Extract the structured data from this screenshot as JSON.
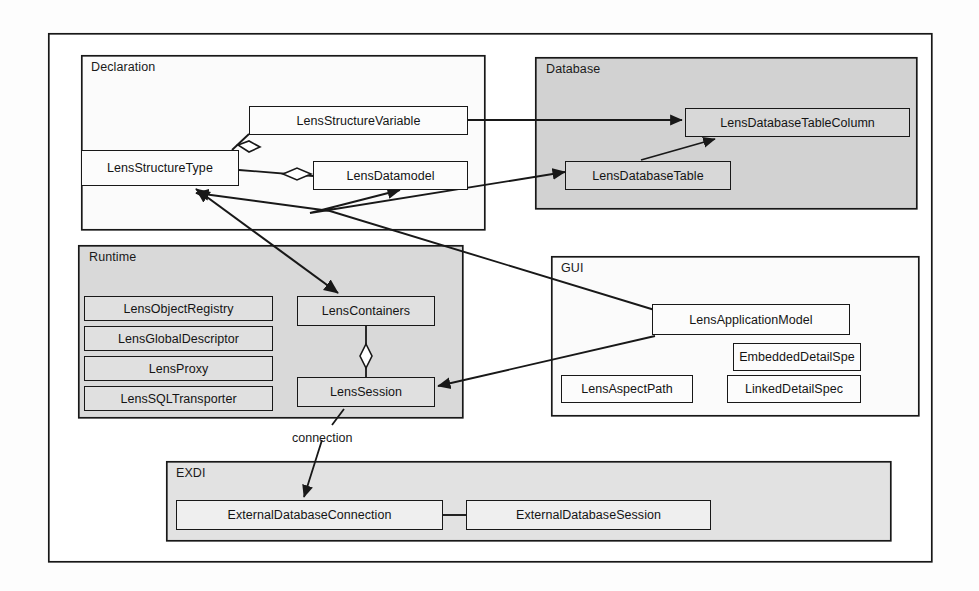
{
  "diagram": {
    "frame": {
      "x": 48,
      "y": 33,
      "w": 884,
      "h": 529
    },
    "colors": {
      "line": "#181818",
      "package_gray": "#d0d0d0",
      "package_white": "#fcfcfc",
      "class_fill": "#f7f7f7",
      "page_bg": "#fdfdfd"
    },
    "packages": [
      {
        "id": "declaration",
        "label": "Declaration",
        "x": 81,
        "y": 55,
        "w": 404,
        "h": 175,
        "fill": "#fbfbfb"
      },
      {
        "id": "database",
        "label": "Database",
        "x": 535,
        "y": 57,
        "w": 382,
        "h": 152,
        "fill": "#d2d2d2"
      },
      {
        "id": "runtime",
        "label": "Runtime",
        "x": 78,
        "y": 245,
        "w": 385,
        "h": 173,
        "fill": "#d9d9d9"
      },
      {
        "id": "gui",
        "label": "GUI",
        "x": 551,
        "y": 256,
        "w": 368,
        "h": 160,
        "fill": "#fbfbfb"
      },
      {
        "id": "exdi",
        "label": "EXDI",
        "x": 166,
        "y": 461,
        "w": 725,
        "h": 80,
        "fill": "#e2e2e2"
      }
    ],
    "classes": [
      {
        "id": "lens_structure_variable",
        "label": "LensStructureVariable",
        "x": 249,
        "y": 106,
        "w": 219,
        "h": 29,
        "pkg": "declaration"
      },
      {
        "id": "lens_structure_type",
        "label": "LensStructureType",
        "x": 81,
        "y": 150,
        "w": 158,
        "h": 36,
        "pkg": "declaration"
      },
      {
        "id": "lens_datamodel",
        "label": "LensDatamodel",
        "x": 313,
        "y": 161,
        "w": 155,
        "h": 29,
        "pkg": "declaration"
      },
      {
        "id": "lens_database_table_column",
        "label": "LensDatabaseTableColumn",
        "x": 685,
        "y": 108,
        "w": 225,
        "h": 29,
        "pkg": "database"
      },
      {
        "id": "lens_database_table",
        "label": "LensDatabaseTable",
        "x": 565,
        "y": 161,
        "w": 166,
        "h": 29,
        "pkg": "database"
      },
      {
        "id": "lens_object_registry",
        "label": "LensObjectRegistry",
        "x": 84,
        "y": 296,
        "w": 189,
        "h": 25,
        "pkg": "runtime"
      },
      {
        "id": "lens_global_descriptor",
        "label": "LensGlobalDescriptor",
        "x": 84,
        "y": 326,
        "w": 189,
        "h": 25,
        "pkg": "runtime"
      },
      {
        "id": "lens_proxy",
        "label": "LensProxy",
        "x": 84,
        "y": 356,
        "w": 189,
        "h": 25,
        "pkg": "runtime"
      },
      {
        "id": "lens_sql_transporter",
        "label": "LensSQLTransporter",
        "x": 84,
        "y": 386,
        "w": 189,
        "h": 25,
        "pkg": "runtime"
      },
      {
        "id": "lens_containers",
        "label": "LensContainers",
        "x": 297,
        "y": 296,
        "w": 138,
        "h": 30,
        "pkg": "runtime"
      },
      {
        "id": "lens_session",
        "label": "LensSession",
        "x": 297,
        "y": 377,
        "w": 138,
        "h": 30,
        "pkg": "runtime"
      },
      {
        "id": "lens_application_model",
        "label": "LensApplicationModel",
        "x": 652,
        "y": 304,
        "w": 198,
        "h": 31,
        "pkg": "gui"
      },
      {
        "id": "embedded_detail_spe",
        "label": "EmbeddedDetailSpe",
        "x": 733,
        "y": 343,
        "w": 128,
        "h": 28,
        "pkg": "gui"
      },
      {
        "id": "lens_aspect_path",
        "label": "LensAspectPath",
        "x": 561,
        "y": 375,
        "w": 132,
        "h": 28,
        "pkg": "gui"
      },
      {
        "id": "linked_detail_spec",
        "label": "LinkedDetailSpec",
        "x": 727,
        "y": 375,
        "w": 134,
        "h": 28,
        "pkg": "gui"
      },
      {
        "id": "external_database_connection",
        "label": "ExternalDatabaseConnection",
        "x": 176,
        "y": 500,
        "w": 267,
        "h": 30,
        "pkg": "exdi"
      },
      {
        "id": "external_database_session",
        "label": "ExternalDatabaseSession",
        "x": 466,
        "y": 500,
        "w": 245,
        "h": 30,
        "pkg": "exdi"
      }
    ],
    "edge_labels": [
      {
        "id": "connection",
        "label": "connection",
        "x": 292,
        "y": 431
      }
    ],
    "relations": [
      {
        "from": "lens_structure_variable",
        "to": "lens_structure_type",
        "kind": "aggregation"
      },
      {
        "from": "lens_datamodel",
        "to": "lens_structure_type",
        "kind": "aggregation"
      },
      {
        "from": "lens_structure_variable",
        "to": "lens_database_table_column",
        "kind": "association-arrow"
      },
      {
        "from": "lens_database_table",
        "to": "lens_database_table_column",
        "kind": "association-arrow"
      },
      {
        "from": "lens_datamodel",
        "to": "lens_database_table",
        "kind": "bidirectional"
      },
      {
        "from": "lens_structure_type",
        "to": "lens_containers",
        "kind": "bidirectional"
      },
      {
        "from": "lens_application_model",
        "to": "lens_structure_type",
        "kind": "association-arrow"
      },
      {
        "from": "lens_application_model",
        "to": "lens_session",
        "kind": "association-arrow"
      },
      {
        "from": "lens_containers",
        "to": "lens_session",
        "kind": "aggregation"
      },
      {
        "from": "lens_session",
        "to": "external_database_connection",
        "kind": "association-arrow",
        "label": "connection"
      },
      {
        "from": "external_database_connection",
        "to": "external_database_session",
        "kind": "plain-line"
      }
    ]
  }
}
